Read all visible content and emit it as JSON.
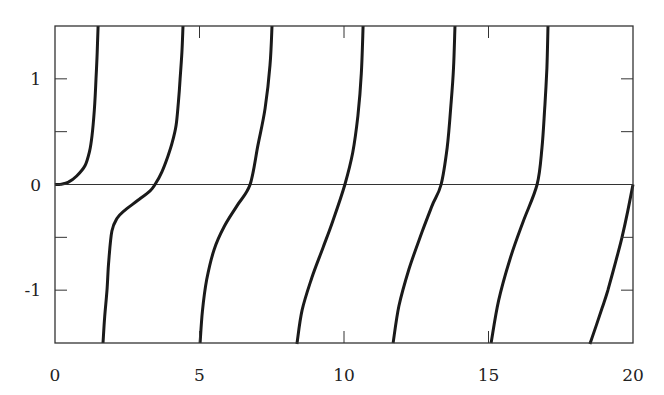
{
  "chart_data": {
    "type": "line",
    "title": "",
    "xlabel": "",
    "ylabel": "",
    "xlim": [
      0,
      20
    ],
    "ylim": [
      -1.5,
      1.5
    ],
    "grid": false,
    "legend": null,
    "x_ticks": [
      0,
      5,
      10,
      15,
      20
    ],
    "x_tick_labels": [
      "0",
      "5",
      "10",
      "15",
      "20"
    ],
    "y_ticks": [
      -1,
      0,
      1
    ],
    "y_tick_labels": [
      "-1",
      "0",
      "1"
    ],
    "y_minor_ticks": [
      -1,
      -0.5,
      0,
      0.5,
      1
    ],
    "zero_line": true,
    "colors": {
      "line": "#1a1a1a",
      "axis": "#333333",
      "background": "#ffffff"
    },
    "series": [
      {
        "name": "branch-1",
        "points": [
          [
            0,
            0
          ],
          [
            0.2,
            0.003
          ],
          [
            0.45,
            0.02
          ],
          [
            0.75,
            0.08
          ],
          [
            1.04,
            0.18
          ],
          [
            1.2,
            0.32
          ],
          [
            1.28,
            0.46
          ],
          [
            1.36,
            0.7
          ],
          [
            1.42,
            1.0
          ],
          [
            1.46,
            1.25
          ],
          [
            1.49,
            1.5
          ]
        ]
      },
      {
        "name": "branch-2",
        "points": [
          [
            1.66,
            -1.5
          ],
          [
            1.72,
            -1.25
          ],
          [
            1.8,
            -1.0
          ],
          [
            1.86,
            -0.72
          ],
          [
            1.97,
            -0.44
          ],
          [
            2.15,
            -0.32
          ],
          [
            2.39,
            -0.25
          ],
          [
            2.87,
            -0.15
          ],
          [
            3.29,
            -0.06
          ],
          [
            3.46,
            0
          ],
          [
            3.7,
            0.12
          ],
          [
            3.91,
            0.27
          ],
          [
            4.06,
            0.4
          ],
          [
            4.19,
            0.56
          ],
          [
            4.27,
            0.78
          ],
          [
            4.33,
            1.0
          ],
          [
            4.39,
            1.25
          ],
          [
            4.43,
            1.5
          ]
        ]
      },
      {
        "name": "branch-3",
        "points": [
          [
            5.02,
            -1.5
          ],
          [
            5.1,
            -1.2
          ],
          [
            5.25,
            -0.9
          ],
          [
            5.5,
            -0.62
          ],
          [
            5.85,
            -0.4
          ],
          [
            6.3,
            -0.2
          ],
          [
            6.75,
            0
          ],
          [
            7.02,
            0.37
          ],
          [
            7.27,
            0.72
          ],
          [
            7.44,
            1.13
          ],
          [
            7.51,
            1.5
          ]
        ]
      },
      {
        "name": "branch-4",
        "points": [
          [
            8.37,
            -1.51
          ],
          [
            8.55,
            -1.19
          ],
          [
            8.89,
            -0.88
          ],
          [
            9.27,
            -0.6
          ],
          [
            9.62,
            -0.34
          ],
          [
            10.03,
            0
          ],
          [
            10.3,
            0.3
          ],
          [
            10.48,
            0.65
          ],
          [
            10.6,
            1.05
          ],
          [
            10.66,
            1.5
          ]
        ]
      },
      {
        "name": "branch-5",
        "points": [
          [
            11.7,
            -1.5
          ],
          [
            11.9,
            -1.15
          ],
          [
            12.25,
            -0.8
          ],
          [
            12.7,
            -0.45
          ],
          [
            13.05,
            -0.2
          ],
          [
            13.36,
            0
          ],
          [
            13.57,
            0.35
          ],
          [
            13.7,
            0.75
          ],
          [
            13.79,
            1.1
          ],
          [
            13.84,
            1.5
          ]
        ]
      },
      {
        "name": "branch-6",
        "points": [
          [
            15.09,
            -1.5
          ],
          [
            15.35,
            -1.1
          ],
          [
            15.75,
            -0.7
          ],
          [
            16.2,
            -0.35
          ],
          [
            16.68,
            0
          ],
          [
            16.85,
            0.35
          ],
          [
            16.95,
            0.75
          ],
          [
            17.02,
            1.1
          ],
          [
            17.06,
            1.5
          ]
        ]
      },
      {
        "name": "branch-7",
        "points": [
          [
            18.51,
            -1.51
          ],
          [
            18.93,
            -1.17
          ],
          [
            19.13,
            -1.0
          ],
          [
            19.4,
            -0.73
          ],
          [
            19.62,
            -0.5
          ],
          [
            19.82,
            -0.25
          ],
          [
            20.0,
            0
          ]
        ]
      }
    ]
  }
}
